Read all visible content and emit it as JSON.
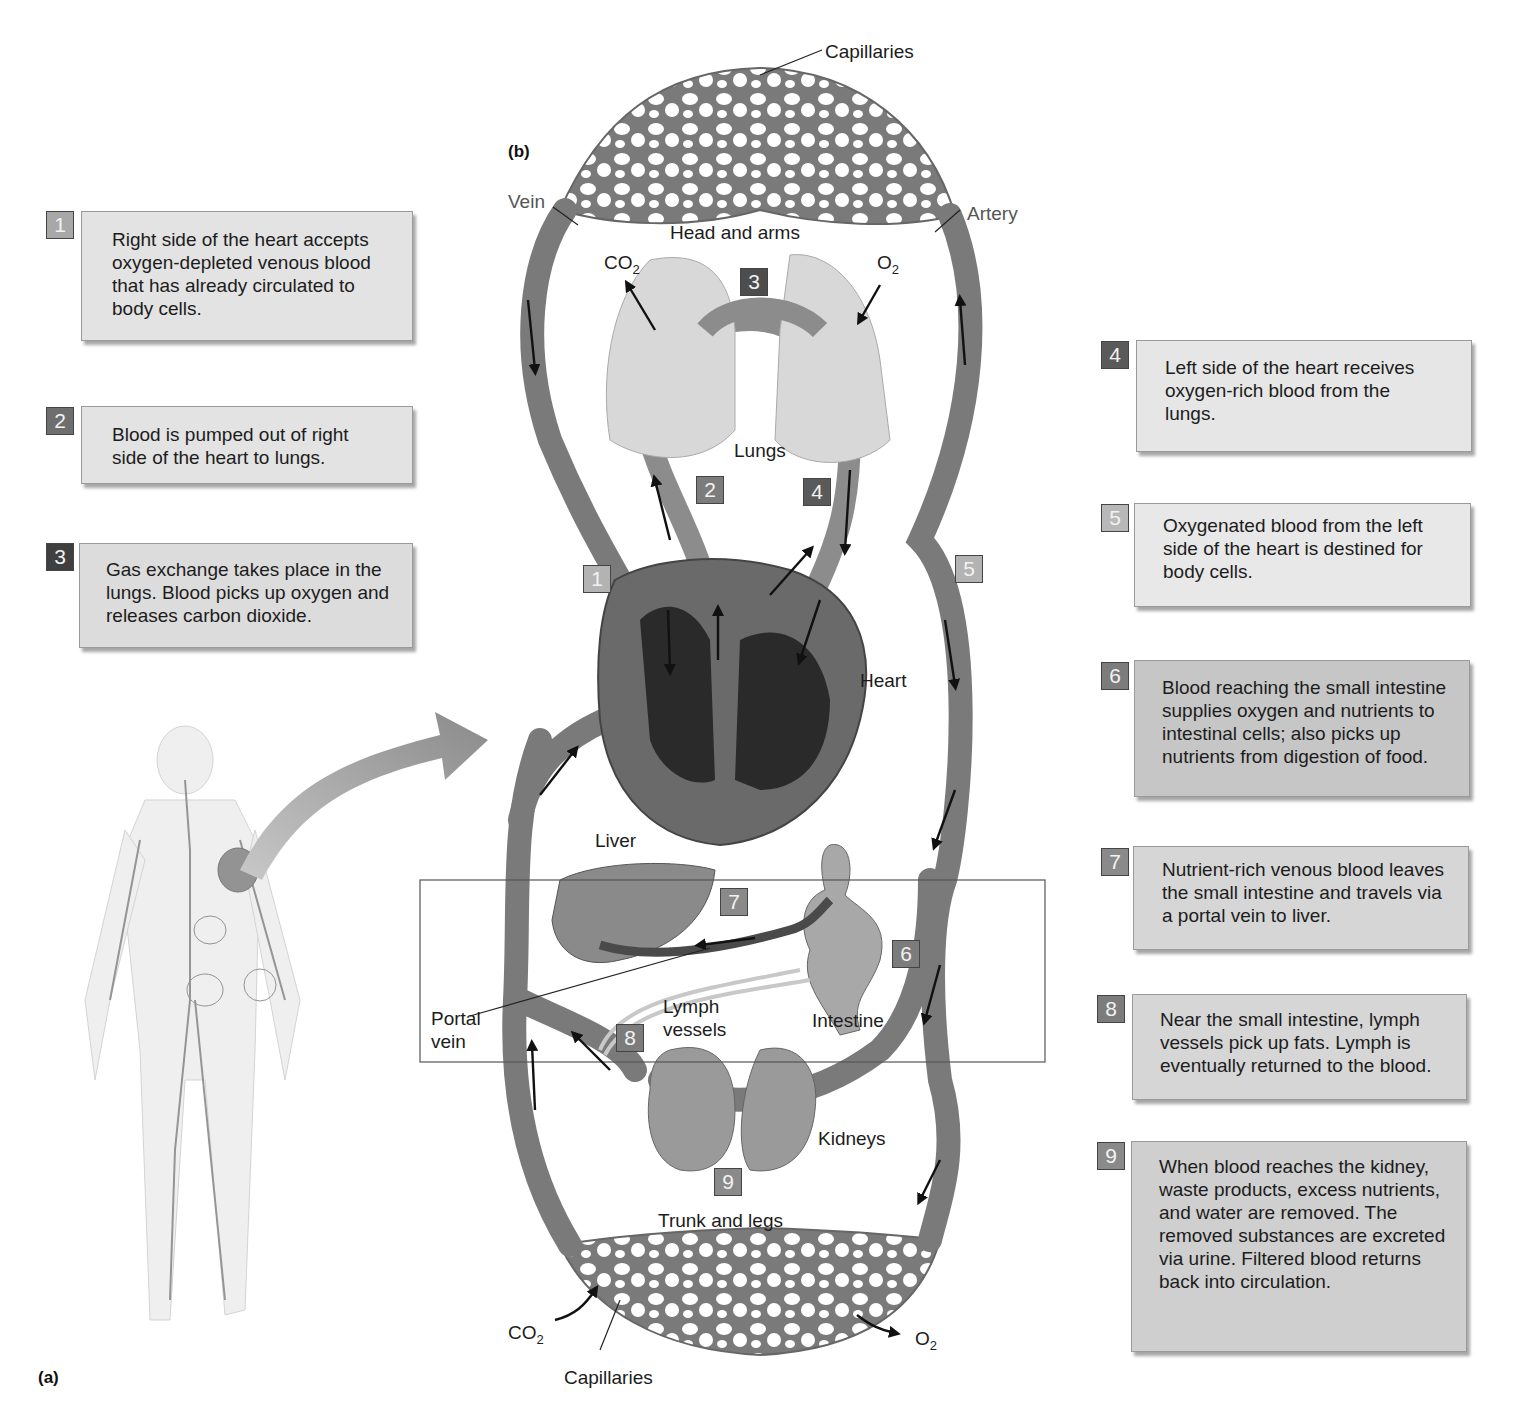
{
  "figure": {
    "panel_a_label": "(a)",
    "panel_b_label": "(b)"
  },
  "colors": {
    "vessel": "#7a7a7a",
    "vessel_dark": "#4a4a4a",
    "lung": "#d6d6d6",
    "box_fill_light": "#e6e6e6",
    "box_fill_mid": "#d8d8d8",
    "box_fill_dark": "#c4c4c4",
    "badge_dark": "#4d4d4d",
    "badge_mid": "#7c7c7c",
    "badge_light": "#b3b3b3"
  },
  "steps": [
    {
      "number": "1",
      "text_lines": [
        "Right side of the heart accepts",
        "oxygen-depleted venous blood",
        "that has already circulated to",
        "body cells."
      ]
    },
    {
      "number": "2",
      "text_lines": [
        "Blood is pumped out of right",
        "side of the heart to lungs."
      ]
    },
    {
      "number": "3",
      "text_lines": [
        "Gas exchange takes place in the",
        "lungs. Blood picks up oxygen and",
        "releases carbon dioxide."
      ]
    },
    {
      "number": "4",
      "text_lines": [
        "Left side of the heart receives",
        "oxygen-rich blood from the",
        "lungs."
      ]
    },
    {
      "number": "5",
      "text_lines": [
        "Oxygenated blood from the left",
        "side of the heart is destined for",
        "body cells."
      ]
    },
    {
      "number": "6",
      "text_lines": [
        "Blood reaching the small intestine",
        "supplies oxygen and nutrients to",
        "intestinal cells; also picks up",
        "nutrients from digestion of food."
      ]
    },
    {
      "number": "7",
      "text_lines": [
        "Nutrient-rich venous blood leaves",
        "the small intestine and travels via",
        "a portal vein to liver."
      ]
    },
    {
      "number": "8",
      "text_lines": [
        "Near the small intestine, lymph",
        "vessels pick up fats. Lymph is",
        "eventually returned to the blood."
      ]
    },
    {
      "number": "9",
      "text_lines": [
        "When blood reaches the kidney,",
        "waste products, excess nutrients,",
        "and water are removed. The",
        "removed substances are excreted",
        "via urine. Filtered blood returns",
        "back into circulation."
      ]
    }
  ],
  "diagram_labels": {
    "capillaries_top": "Capillaries",
    "vein": "Vein",
    "artery": "Artery",
    "head_and_arms": "Head and arms",
    "co2_top": "CO",
    "o2_top": "O",
    "subscript_2": "2",
    "lungs": "Lungs",
    "heart": "Heart",
    "liver": "Liver",
    "portal_vein_line1": "Portal",
    "portal_vein_line2": "vein",
    "lymph_vessels_line1": "Lymph",
    "lymph_vessels_line2": "vessels",
    "intestine": "Intestine",
    "kidneys": "Kidneys",
    "trunk_and_legs": "Trunk and legs",
    "co2_bottom": "CO",
    "o2_bottom": "O",
    "capillaries_bottom": "Capillaries"
  },
  "diagram_badges": [
    "1",
    "2",
    "3",
    "4",
    "5",
    "6",
    "7",
    "8",
    "9"
  ]
}
